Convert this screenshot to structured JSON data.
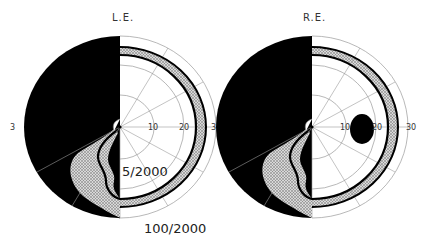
{
  "figure": {
    "type": "visual-field-perimetry",
    "panels": [
      {
        "id": "left",
        "title": "L.E.",
        "eccentricity_ticks": [
          "10",
          "20",
          "3"
        ],
        "left_edge_label": "3",
        "isopters": [
          "5/2000",
          "100/2000"
        ],
        "features": [
          "nasal-hemifield-loss",
          "stippled-relative-defect-inferior",
          "stippled-ring-between-isopters"
        ]
      },
      {
        "id": "right",
        "title": "R.E.",
        "eccentricity_ticks": [
          "10",
          "20",
          "30"
        ],
        "left_edge_label": "3",
        "features": [
          "temporal-hemifield-loss",
          "blind-spot",
          "stippled-relative-defect-inferior",
          "stippled-ring-between-isopters"
        ]
      }
    ],
    "isopter_labels": {
      "inner": "5/2000",
      "outer": "100/2000"
    }
  },
  "colors": {
    "defect": "#000000",
    "relative_defect": "#bdbdbd",
    "grid": "#9a9a9a",
    "background": "#ffffff"
  }
}
